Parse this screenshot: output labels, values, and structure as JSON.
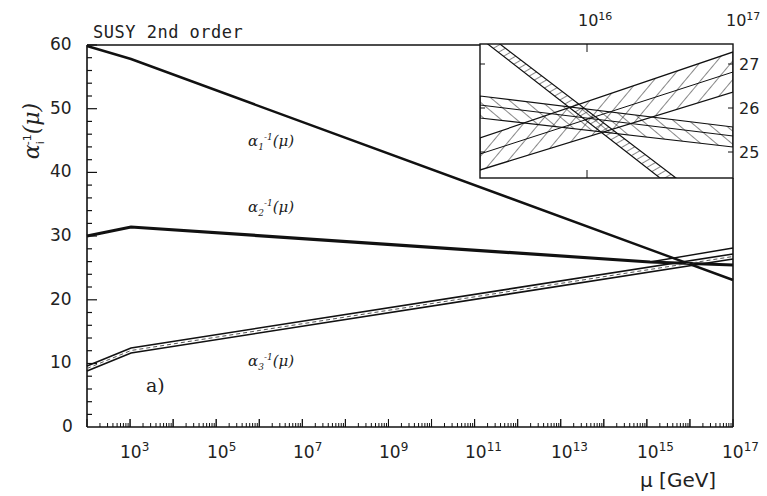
{
  "chart_data": {
    "type": "line",
    "title": "SUSY 2nd order",
    "panel_label": "a)",
    "xlabel": "μ [GeV]",
    "ylabel": "α_i^-1(μ)",
    "xscale": "log10",
    "xlim_log10": [
      2,
      17
    ],
    "ylim": [
      0,
      60
    ],
    "x_tick_labels": [
      "10^3",
      "10^5",
      "10^7",
      "10^9",
      "10^11",
      "10^13",
      "10^15",
      "10^17"
    ],
    "y_tick_labels": [
      "0",
      "10",
      "20",
      "30",
      "40",
      "50",
      "60"
    ],
    "series": [
      {
        "name": "α1^-1(μ)",
        "x_log10": [
          2,
          3,
          17
        ],
        "values": [
          59.5,
          57.8,
          23.3
        ]
      },
      {
        "name": "α2^-1(μ)",
        "x_log10": [
          2,
          3,
          17
        ],
        "values": [
          30.1,
          31.4,
          25.4
        ]
      },
      {
        "name": "α3^-1(μ)",
        "x_log10": [
          2,
          3,
          17
        ],
        "values": [
          9.2,
          12.0,
          26.9
        ]
      }
    ],
    "inset": {
      "description": "zoom of unification region with hatched error bands",
      "x_tick_labels": [
        "10^16",
        "10^17"
      ],
      "y_tick_labels": [
        "25",
        "26",
        "27"
      ],
      "ylim": [
        24.5,
        27.5
      ]
    }
  },
  "labels": {
    "title": "SUSY 2nd order",
    "panel": "a)",
    "xlabel": "μ [GeV]",
    "ylabel_main": "α",
    "ylabel_sub": "i",
    "ylabel_sup": "-1",
    "ylabel_arg": "(μ)",
    "a1": {
      "base": "α",
      "sub": "1",
      "sup": "-1",
      "arg": "(μ)"
    },
    "a2": {
      "base": "α",
      "sub": "2",
      "sup": "-1",
      "arg": "(μ)"
    },
    "a3": {
      "base": "α",
      "sub": "3",
      "sup": "-1",
      "arg": "(μ)"
    }
  },
  "axes": {
    "y": [
      "60",
      "50",
      "40",
      "30",
      "20",
      "10",
      "0"
    ],
    "x": [
      {
        "base": "10",
        "exp": "3"
      },
      {
        "base": "10",
        "exp": "5"
      },
      {
        "base": "10",
        "exp": "7"
      },
      {
        "base": "10",
        "exp": "9"
      },
      {
        "base": "10",
        "exp": "11"
      },
      {
        "base": "10",
        "exp": "13"
      },
      {
        "base": "10",
        "exp": "15"
      },
      {
        "base": "10",
        "exp": "17"
      }
    ],
    "inset_x": [
      {
        "base": "10",
        "exp": "16"
      },
      {
        "base": "10",
        "exp": "17"
      }
    ],
    "inset_y": [
      "27",
      "26",
      "25"
    ]
  }
}
